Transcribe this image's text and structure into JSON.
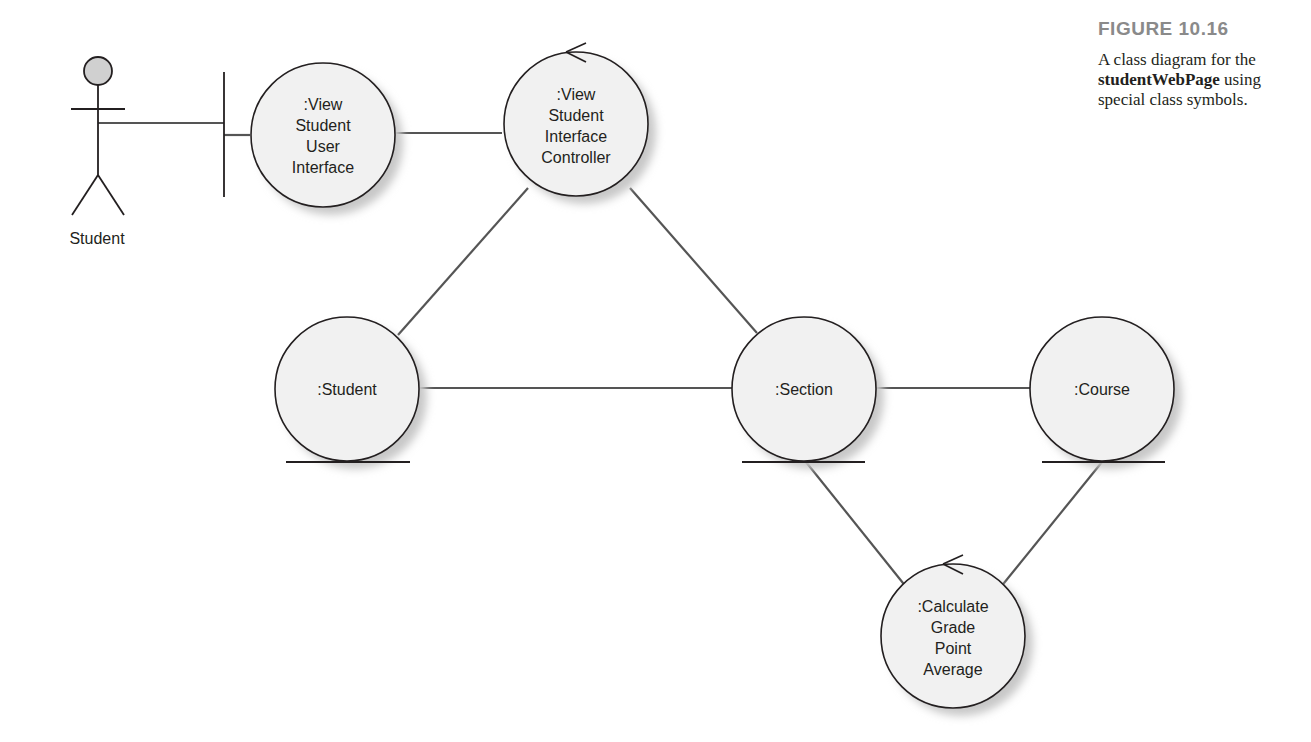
{
  "figure": {
    "number": "FIGURE 10.16",
    "caption_prefix": "A class diagram for the ",
    "caption_bold": "studentWebPage",
    "caption_suffix": " using special class symbols."
  },
  "colors": {
    "stroke": "#231f20",
    "line": "#555555",
    "node_fill": "#f1f1f1",
    "shadow": "#c8c8c8",
    "actor_head": "#d0d0d0",
    "figure_number": "#8a8a8a"
  },
  "actor": {
    "label": "Student"
  },
  "nodes": {
    "view_ui": {
      "type": "boundary",
      "lines": [
        ":View",
        "Student",
        "User",
        "Interface"
      ]
    },
    "view_controller": {
      "type": "control",
      "lines": [
        ":View",
        "Student",
        "Interface",
        "Controller"
      ]
    },
    "student": {
      "type": "entity",
      "lines": [
        ":Student"
      ]
    },
    "section": {
      "type": "entity",
      "lines": [
        ":Section"
      ]
    },
    "course": {
      "type": "entity",
      "lines": [
        ":Course"
      ]
    },
    "calc_gpa": {
      "type": "control",
      "lines": [
        ":Calculate",
        "Grade",
        "Point",
        "Average"
      ]
    }
  }
}
